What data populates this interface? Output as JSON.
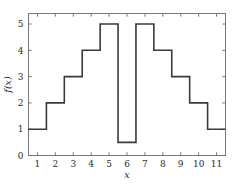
{
  "chart_data": {
    "type": "line",
    "style": "step",
    "step_mode": "mid",
    "title": "",
    "subtitle": "",
    "xlabel": "x",
    "ylabel": "f(x)",
    "x": [
      1,
      2,
      3,
      4,
      5,
      6,
      7,
      8,
      9,
      10,
      11
    ],
    "values": [
      1,
      2,
      3,
      4,
      5,
      0.5,
      5,
      4,
      3,
      2,
      1
    ],
    "series": [
      {
        "name": "f(x)",
        "values": [
          1,
          2,
          3,
          4,
          5,
          0.5,
          5,
          4,
          3,
          2,
          1
        ]
      }
    ],
    "xlim": [
      0.5,
      11.5
    ],
    "ylim": [
      0,
      5.4
    ],
    "xticks": [
      1,
      2,
      3,
      4,
      5,
      6,
      7,
      8,
      9,
      10,
      11
    ],
    "yticks": [
      0,
      1,
      2,
      3,
      4,
      5
    ],
    "xtick_labels": [
      "1",
      "2",
      "3",
      "4",
      "5",
      "6",
      "7",
      "8",
      "9",
      "10",
      "11"
    ],
    "ytick_labels": [
      "0",
      "1",
      "2",
      "3",
      "4",
      "5"
    ],
    "grid": false,
    "legend": null,
    "legend_position": "none",
    "annotations": [],
    "line_color": "#3a3a3a",
    "frame_color": "#6b6b6b",
    "background_color": "#ffffff",
    "ticks_all_sides": true
  },
  "axes": {
    "x_title": "x",
    "y_title": "f(x)"
  }
}
